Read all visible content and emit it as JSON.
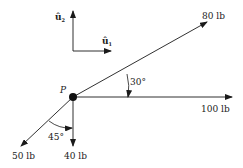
{
  "diagram": {
    "title": "",
    "point": {
      "label": "P"
    },
    "basis": {
      "u1_label": "û",
      "u1_sub": "1",
      "u2_label": "û",
      "u2_sub": "2"
    },
    "forces": [
      {
        "id": "f80",
        "magnitude_label": "80 lb",
        "direction_deg": 30
      },
      {
        "id": "f100",
        "magnitude_label": "100 lb",
        "direction_deg": 0
      },
      {
        "id": "f40",
        "magnitude_label": "40 lb",
        "direction_deg": -90
      },
      {
        "id": "f50",
        "magnitude_label": "50 lb",
        "direction_deg": -135
      }
    ],
    "angles": [
      {
        "id": "a30",
        "label": "30°",
        "between": [
          "f100",
          "f80"
        ]
      },
      {
        "id": "a45",
        "label": "45°",
        "between": [
          "f40",
          "f50"
        ]
      }
    ],
    "colors": {
      "stroke": "#1a1a1a",
      "background": "#ffffff"
    }
  }
}
